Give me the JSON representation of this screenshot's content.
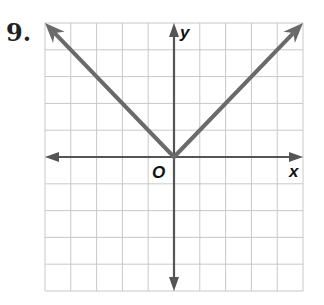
{
  "problem": {
    "number": "9."
  },
  "chart_data": {
    "type": "line",
    "title": "",
    "xlabel": "x",
    "ylabel": "y",
    "origin_label": "O",
    "xlim": [
      -5,
      5
    ],
    "ylim": [
      -5,
      5
    ],
    "grid": true,
    "grid_step": 1,
    "series": [
      {
        "name": "y = |x|",
        "x": [
          -5,
          0,
          5
        ],
        "y": [
          5,
          0,
          5
        ],
        "arrows": "both-ends"
      }
    ]
  },
  "colors": {
    "graph_line": "#6a6a6a",
    "axis": "#555555",
    "grid": "#c8c8c8"
  }
}
